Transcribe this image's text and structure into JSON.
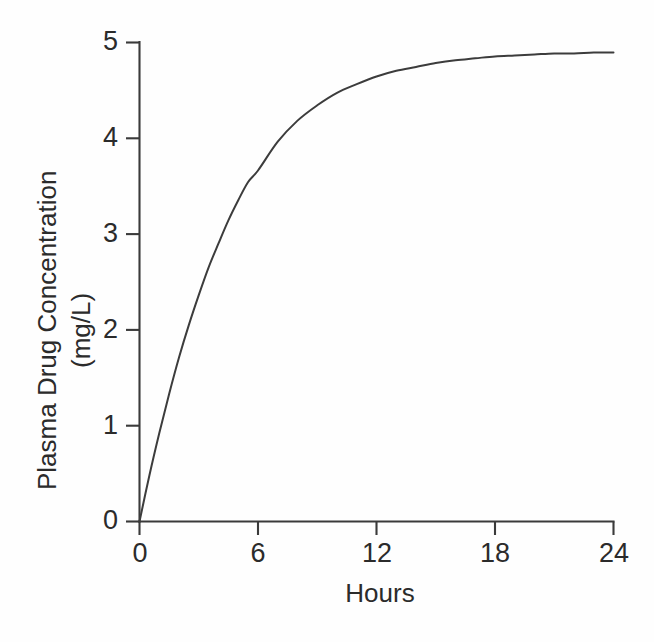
{
  "chart_data": {
    "type": "line",
    "title": "",
    "xlabel": "Hours",
    "ylabel": "Plasma Drug Concentration (mg/L)",
    "ylabel_line1": "Plasma Drug Concentration",
    "ylabel_line2": "(mg/L)",
    "xlim": [
      0,
      24
    ],
    "ylim": [
      0,
      5
    ],
    "grid": false,
    "legend": false,
    "xticks": [
      0,
      6,
      12,
      18,
      24
    ],
    "xtick_labels": [
      "0",
      "6",
      "12",
      "18",
      "24"
    ],
    "yticks": [
      0,
      1,
      2,
      3,
      4,
      5
    ],
    "ytick_labels": [
      "0",
      "1",
      "2",
      "3",
      "4",
      "5"
    ],
    "series": [
      {
        "name": "Plasma drug concentration",
        "color": "#3c3c3c",
        "x": [
          0,
          0.5,
          1,
          1.5,
          2,
          2.5,
          3,
          3.5,
          4,
          4.5,
          5,
          5.5,
          6,
          7,
          8,
          9,
          10,
          11,
          12,
          13,
          14,
          15,
          16,
          17,
          18,
          19,
          20,
          21,
          22,
          23,
          24
        ],
        "y": [
          0.0,
          0.48,
          0.92,
          1.33,
          1.71,
          2.05,
          2.36,
          2.65,
          2.9,
          3.14,
          3.35,
          3.54,
          3.66,
          3.96,
          4.18,
          4.34,
          4.47,
          4.56,
          4.64,
          4.7,
          4.74,
          4.78,
          4.81,
          4.83,
          4.85,
          4.86,
          4.87,
          4.88,
          4.88,
          4.89,
          4.89
        ]
      }
    ],
    "annotations": []
  },
  "axes": {
    "x_tick_values": [
      "0",
      "6",
      "12",
      "18",
      "24"
    ],
    "y_tick_values": [
      "5",
      "4",
      "3",
      "2",
      "1",
      "0"
    ],
    "x_title": "Hours",
    "y_title_line1": "Plasma Drug Concentration",
    "y_title_line2": "(mg/L)"
  },
  "style": {
    "background": "#fefefe",
    "axis_color": "#3a3a3a",
    "curve_color": "#3c3c3c",
    "text_color": "#2b2b2b"
  }
}
